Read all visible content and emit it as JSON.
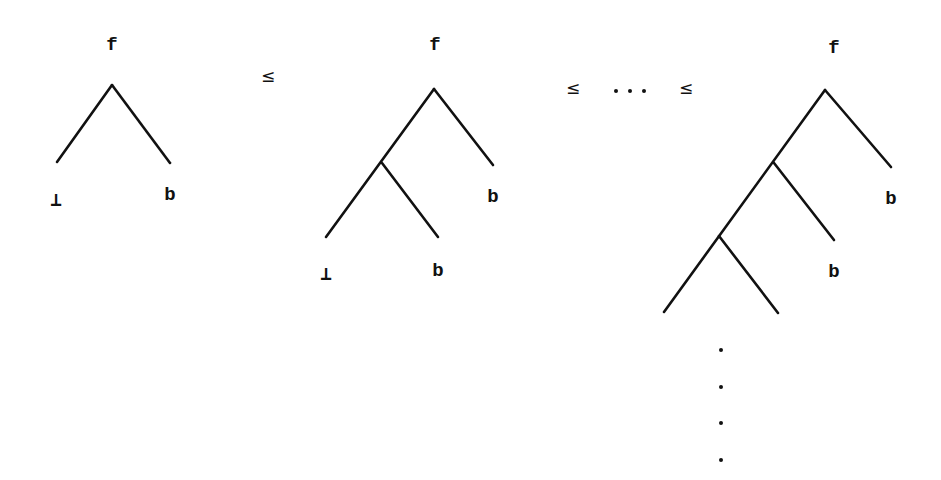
{
  "diagram": {
    "relations": {
      "le1": "≤",
      "le2": "≤",
      "ellipsis": "...",
      "le3": "≤"
    },
    "trees": [
      {
        "root": "f",
        "leaves": {
          "bottom": "⊥",
          "right": "b"
        }
      },
      {
        "root": "f",
        "leaves": {
          "right": "b",
          "inner_right": "b",
          "bottom": "⊥"
        }
      },
      {
        "root": "f",
        "leaves": {
          "right": "b",
          "inner_right": "b"
        },
        "continuation": "vertical ellipsis (infinite)"
      }
    ],
    "colors": {
      "ink": "#111111",
      "background": "#ffffff"
    }
  }
}
